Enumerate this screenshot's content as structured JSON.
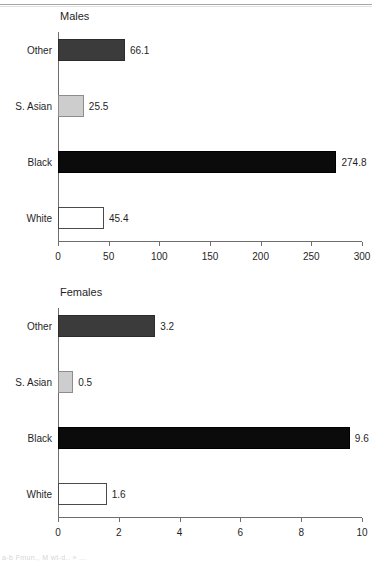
{
  "page": {
    "caption_fragment": "a-b  Fmun., M wt-d..   »  ...",
    "background_color": "#ffffff"
  },
  "colors": {
    "bar_other": "#3b3b3b",
    "bar_s_asian": "#cdcdcd",
    "bar_black": "#0b0b0b",
    "bar_white": "#ffffff",
    "axis": "#6e6e6e",
    "text": "#1f1f1f"
  },
  "chart_data": [
    {
      "id": "males",
      "type": "bar",
      "orientation": "horizontal",
      "title": "Males",
      "xlabel": "",
      "ylabel": "",
      "categories": [
        "White",
        "Black",
        "S. Asian",
        "Other"
      ],
      "values": [
        45.4,
        274.8,
        25.5,
        66.1
      ],
      "value_labels": [
        "45.4",
        "274.8",
        "25.5",
        "66.1"
      ],
      "bar_styles": [
        "white",
        "black",
        "light",
        "dark"
      ],
      "xlim": [
        0,
        300
      ],
      "xticks": [
        0,
        50,
        100,
        150,
        200,
        250,
        300
      ],
      "xtick_labels": [
        "0",
        "50",
        "100",
        "150",
        "200",
        "250",
        "300"
      ],
      "grid": false,
      "legend": null
    },
    {
      "id": "females",
      "type": "bar",
      "orientation": "horizontal",
      "title": "Females",
      "xlabel": "",
      "ylabel": "",
      "categories": [
        "White",
        "Black",
        "S. Asian",
        "Other"
      ],
      "values": [
        1.6,
        9.6,
        0.5,
        3.2
      ],
      "value_labels": [
        "1.6",
        "9.6",
        "0.5",
        "3.2"
      ],
      "bar_styles": [
        "white",
        "black",
        "light",
        "dark"
      ],
      "xlim": [
        0,
        10
      ],
      "xticks": [
        0,
        2,
        4,
        6,
        8,
        10
      ],
      "xtick_labels": [
        "0",
        "2",
        "4",
        "6",
        "8",
        "10"
      ],
      "grid": false,
      "legend": null
    }
  ]
}
